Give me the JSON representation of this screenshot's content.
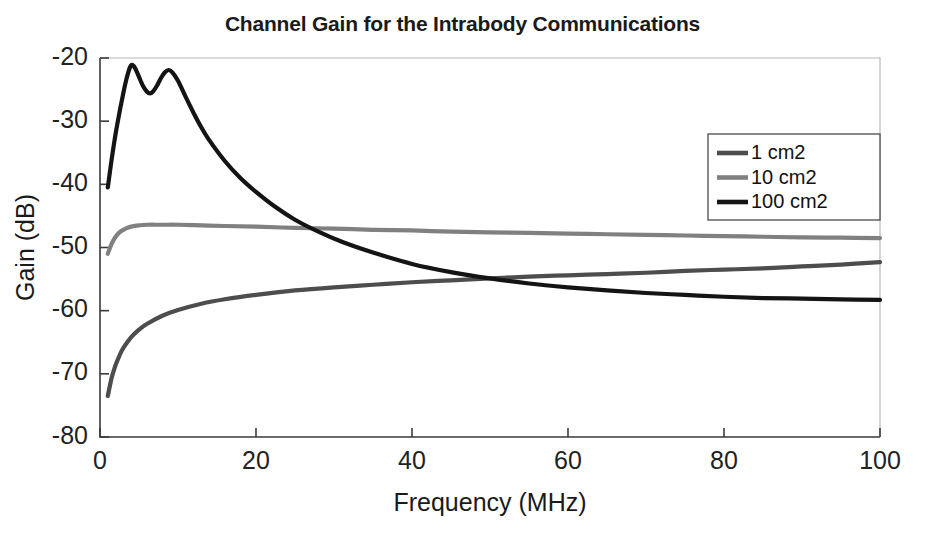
{
  "chart_data": {
    "type": "line",
    "title": "Channel Gain for the Intrabody Communications",
    "xlabel": "Frequency (MHz)",
    "ylabel": "Gain (dB)",
    "xlim": [
      0,
      100
    ],
    "ylim": [
      -80,
      -20
    ],
    "xticks": [
      0,
      20,
      40,
      60,
      80,
      100
    ],
    "yticks": [
      -20,
      -30,
      -40,
      -50,
      -60,
      -70,
      -80
    ],
    "xtick_labels": [
      "0",
      "20",
      "40",
      "60",
      "80",
      "100"
    ],
    "ytick_labels": [
      "-20",
      "-30",
      "-40",
      "-50",
      "-60",
      "-70",
      "-80"
    ],
    "grid": false,
    "legend_position": "upper right",
    "series": [
      {
        "name": "1 cm2",
        "color": "#4d4d4d",
        "x": [
          1,
          1.5,
          2,
          2.5,
          3,
          4,
          5,
          6,
          8,
          10,
          13,
          16,
          20,
          25,
          30,
          35,
          40,
          45,
          50,
          55,
          60,
          65,
          70,
          75,
          80,
          85,
          90,
          95,
          100
        ],
        "y": [
          -73.5,
          -70.6,
          -68.6,
          -67.1,
          -65.9,
          -64.2,
          -63.0,
          -62.1,
          -60.8,
          -59.9,
          -58.9,
          -58.2,
          -57.5,
          -56.8,
          -56.3,
          -55.9,
          -55.5,
          -55.2,
          -54.9,
          -54.6,
          -54.4,
          -54.2,
          -54.0,
          -53.7,
          -53.5,
          -53.3,
          -53.0,
          -52.7,
          -52.3
        ]
      },
      {
        "name": "10 cm2",
        "color": "#808080",
        "x": [
          1,
          1.5,
          2,
          2.5,
          3,
          3.5,
          4,
          5,
          6,
          8,
          10,
          13,
          16,
          20,
          25,
          30,
          35,
          40,
          45,
          50,
          55,
          60,
          65,
          70,
          75,
          80,
          85,
          90,
          95,
          100
        ],
        "y": [
          -51.0,
          -49.4,
          -48.3,
          -47.6,
          -47.2,
          -46.9,
          -46.7,
          -46.5,
          -46.4,
          -46.4,
          -46.4,
          -46.5,
          -46.6,
          -46.7,
          -46.9,
          -47.0,
          -47.2,
          -47.3,
          -47.5,
          -47.6,
          -47.7,
          -47.8,
          -47.9,
          -48.0,
          -48.1,
          -48.2,
          -48.3,
          -48.4,
          -48.45,
          -48.5
        ]
      },
      {
        "name": "100 cm2",
        "color": "#141414",
        "x": [
          1,
          1.5,
          2,
          2.5,
          3,
          3.4,
          3.8,
          4.1,
          4.5,
          5,
          5.5,
          6.0,
          6.4,
          6.8,
          7.3,
          7.8,
          8.3,
          8.8,
          9.3,
          10,
          11,
          12,
          13,
          14,
          16,
          18,
          20,
          22.5,
          25,
          28,
          31,
          35,
          40,
          45,
          50,
          55,
          60,
          65,
          70,
          75,
          80,
          85,
          90,
          95,
          100
        ],
        "y": [
          -40.5,
          -36.0,
          -32.0,
          -28.6,
          -25.5,
          -23.3,
          -21.6,
          -21.1,
          -21.6,
          -23.0,
          -24.4,
          -25.3,
          -25.6,
          -25.3,
          -24.4,
          -23.2,
          -22.3,
          -21.9,
          -22.3,
          -23.6,
          -26.2,
          -28.7,
          -31.0,
          -33.0,
          -36.3,
          -39.0,
          -41.2,
          -43.6,
          -45.6,
          -47.5,
          -49.1,
          -50.8,
          -52.6,
          -53.9,
          -54.9,
          -55.7,
          -56.3,
          -56.8,
          -57.2,
          -57.5,
          -57.8,
          -58.0,
          -58.1,
          -58.2,
          -58.3
        ]
      }
    ]
  },
  "legend": {
    "items": [
      {
        "label": "1 cm2"
      },
      {
        "label": "10 cm2"
      },
      {
        "label": "100 cm2"
      }
    ]
  }
}
